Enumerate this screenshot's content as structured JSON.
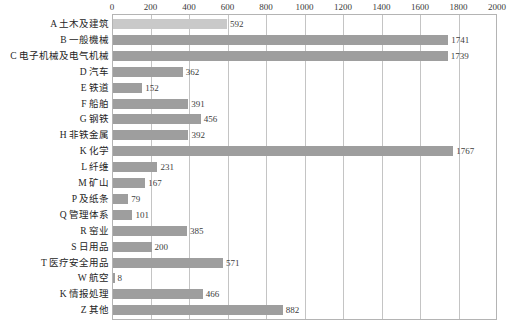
{
  "chart_data": {
    "type": "bar",
    "orientation": "horizontal",
    "title": "",
    "subtitle": "",
    "xlabel": "",
    "ylabel": "",
    "xlim": [
      0,
      2000
    ],
    "ylim": null,
    "grid": true,
    "grid_axis": "x",
    "legend": false,
    "legend_position": "none",
    "tick_step": 200,
    "ticks": [
      0,
      200,
      400,
      600,
      800,
      1000,
      1200,
      1400,
      1600,
      1800,
      2000
    ],
    "tick_labels": [
      "0",
      "200",
      "400",
      "600",
      "800",
      "1000",
      "1200",
      "1400",
      "1600",
      "1800",
      "2000"
    ],
    "categories": [
      "A 土木及建筑",
      "B 一般機械",
      "C 电子机械及电气机械",
      "D 汽车",
      "E 铁道",
      "F 船舶",
      "G 钢铁",
      "H 非铁金属",
      "K 化学",
      "L 纤维",
      "M 矿山",
      "P 及纸条",
      "Q 管理体系",
      "R 窑业",
      "S 日用品",
      "T 医疗安全用品",
      "W 航空",
      "K 情报処理",
      "Z 其他"
    ],
    "values": [
      592,
      1741,
      1739,
      362,
      152,
      391,
      456,
      392,
      1767,
      231,
      167,
      79,
      101,
      385,
      200,
      571,
      8,
      466,
      882
    ],
    "value_labels": [
      "592",
      "1741",
      "1739",
      "362",
      "152",
      "391",
      "456",
      "392",
      "1767",
      "231",
      "167",
      "79",
      "101",
      "385",
      "200",
      "571",
      "8",
      "466",
      "882"
    ],
    "colors": {
      "bar_default": "#9e9e9e",
      "bar_first": "#c9c9c9",
      "grid": "#c4c4c4",
      "frame": "#b4b4b4",
      "text": "#252525"
    }
  }
}
